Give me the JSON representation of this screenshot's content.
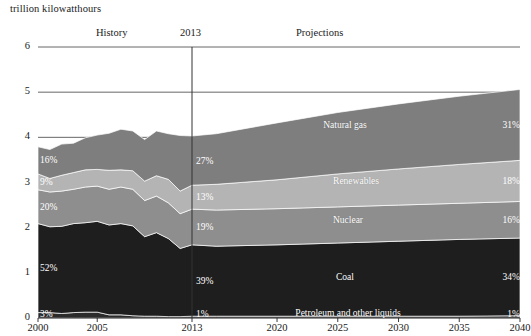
{
  "header": {
    "axis_unit_title": "trillion kilowatthours",
    "history_label": "History",
    "divider_year_label": "2013",
    "projections_label": "Projections"
  },
  "axes": {
    "y_ticks": [
      "0",
      "1",
      "2",
      "3",
      "4",
      "5",
      "6"
    ],
    "x_ticks": [
      "2000",
      "2005",
      "2013",
      "2020",
      "2025",
      "2030",
      "2035",
      "2040"
    ]
  },
  "series_labels": {
    "natural_gas": "Natural gas",
    "renewables": "Renewables",
    "nuclear": "Nuclear",
    "coal": "Coal",
    "petroleum": "Petroleum and other liquids"
  },
  "share_labels": {
    "start_year": {
      "natural_gas": "16%",
      "renewables": "9%",
      "nuclear": "20%",
      "coal": "52%",
      "petroleum": "3%"
    },
    "divider_year": {
      "natural_gas": "27%",
      "renewables": "13%",
      "nuclear": "19%",
      "coal": "39%",
      "petroleum": "1%"
    },
    "end_year": {
      "natural_gas": "31%",
      "renewables": "18%",
      "nuclear": "16%",
      "coal": "34%",
      "petroleum": "1%"
    }
  },
  "colors": {
    "natural_gas": "#7e7e7e",
    "renewables": "#b4b4b4",
    "nuclear": "#8e8e8e",
    "coal": "#1e1e1e",
    "petroleum": "#2b2b2b",
    "gridline": "#555555",
    "divider_line": "#333333",
    "text": "#1a1a1a",
    "label_text": "#ffffff"
  },
  "chart_data": {
    "type": "area",
    "stacked": true,
    "title": "",
    "subtitle": "",
    "xlabel": "",
    "ylabel": "trillion kilowatthours",
    "ylim": [
      0,
      6
    ],
    "xlim": [
      2000,
      2040
    ],
    "grid": true,
    "legend": "inline-annotations",
    "y_tick_values": [
      0,
      1,
      2,
      3,
      4,
      5,
      6
    ],
    "x_tick_values": [
      2000,
      2005,
      2013,
      2020,
      2025,
      2030,
      2035,
      2040
    ],
    "divider_x": 2013,
    "x": [
      2000,
      2001,
      2002,
      2003,
      2004,
      2005,
      2006,
      2007,
      2008,
      2009,
      2010,
      2011,
      2012,
      2013,
      2015,
      2020,
      2025,
      2030,
      2035,
      2040
    ],
    "stack_order_bottom_to_top": [
      "Petroleum and other liquids",
      "Coal",
      "Nuclear",
      "Renewables",
      "Natural gas"
    ],
    "series": [
      {
        "name": "Petroleum and other liquids",
        "color": "#2b2b2b",
        "values": [
          0.12,
          0.12,
          0.1,
          0.12,
          0.13,
          0.13,
          0.07,
          0.07,
          0.05,
          0.04,
          0.04,
          0.03,
          0.03,
          0.04,
          0.04,
          0.04,
          0.04,
          0.04,
          0.04,
          0.05
        ],
        "share_start": "3%",
        "share_divider": "1%",
        "share_end": "1%"
      },
      {
        "name": "Coal",
        "color": "#1e1e1e",
        "values": [
          1.97,
          1.9,
          1.93,
          1.97,
          1.98,
          2.01,
          1.99,
          2.02,
          1.99,
          1.76,
          1.85,
          1.73,
          1.51,
          1.58,
          1.55,
          1.58,
          1.62,
          1.66,
          1.7,
          1.72
        ],
        "share_start": "52%",
        "share_divider": "39%",
        "share_end": "34%"
      },
      {
        "name": "Nuclear",
        "color": "#8e8e8e",
        "values": [
          0.75,
          0.77,
          0.78,
          0.76,
          0.79,
          0.78,
          0.79,
          0.81,
          0.81,
          0.8,
          0.81,
          0.79,
          0.77,
          0.79,
          0.8,
          0.8,
          0.8,
          0.8,
          0.8,
          0.81
        ],
        "share_start": "20%",
        "share_divider": "19%",
        "share_end": "16%"
      },
      {
        "name": "Renewables",
        "color": "#b4b4b4",
        "values": [
          0.35,
          0.3,
          0.35,
          0.37,
          0.38,
          0.37,
          0.42,
          0.38,
          0.41,
          0.43,
          0.45,
          0.52,
          0.5,
          0.53,
          0.57,
          0.64,
          0.73,
          0.8,
          0.86,
          0.91
        ],
        "share_start": "9%",
        "share_divider": "13%",
        "share_end": "18%"
      },
      {
        "name": "Natural gas",
        "color": "#7e7e7e",
        "values": [
          0.6,
          0.64,
          0.69,
          0.65,
          0.71,
          0.76,
          0.82,
          0.9,
          0.88,
          0.92,
          0.99,
          1.01,
          1.23,
          1.09,
          1.12,
          1.26,
          1.36,
          1.44,
          1.51,
          1.57
        ],
        "share_start": "16%",
        "share_divider": "27%",
        "share_end": "31%"
      }
    ],
    "totals": [
      3.79,
      3.73,
      3.85,
      3.87,
      3.99,
      4.05,
      4.09,
      4.18,
      4.14,
      3.95,
      4.14,
      4.08,
      4.04,
      4.03,
      4.08,
      4.32,
      4.55,
      4.74,
      4.91,
      5.06
    ]
  }
}
